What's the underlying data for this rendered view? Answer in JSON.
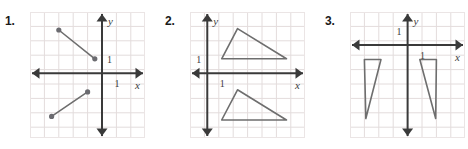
{
  "page": {
    "background": "#ffffff",
    "width": 468,
    "height": 149
  },
  "style": {
    "grid_line_color": "#e3dcdc",
    "panel_border_color": "#ebe5e5",
    "axis_color": "#3a3a3a",
    "figure_color": "#6e6e6e",
    "point_color": "#6b6b70",
    "label_color": "#3b3b3b",
    "number_color": "#1a1a1a"
  },
  "problems": [
    {
      "number": "1.",
      "panel": {
        "x": 30,
        "y": 12,
        "width": 115,
        "height": 126,
        "cell": 14.4,
        "cols": 8,
        "rows": 8.75,
        "origin_col": 5,
        "origin_row": 4.25
      },
      "axes": {
        "x_label": "x",
        "y_label": "y",
        "x_tick_label": "1",
        "y_tick_label": "1"
      },
      "figures": [
        {
          "name": "segment-upper",
          "type": "segment",
          "points": [
            [
              -3,
              3
            ],
            [
              -0.5,
              1
            ]
          ],
          "endpoints_marked": true
        },
        {
          "name": "segment-lower",
          "type": "segment",
          "points": [
            [
              -3.5,
              -3
            ],
            [
              -1,
              -1.3
            ]
          ],
          "endpoints_marked": true
        }
      ]
    },
    {
      "number": "2.",
      "panel": {
        "x": 190,
        "y": 12,
        "width": 115,
        "height": 126,
        "cell": 14.4,
        "cols": 8,
        "rows": 8.75,
        "origin_col": 1.2,
        "origin_row": 4.25
      },
      "axes": {
        "x_label": "x",
        "y_label": "y",
        "x_tick_label": "1",
        "y_tick_label": "1"
      },
      "figures": [
        {
          "name": "triangle-upper",
          "type": "polygon",
          "points": [
            [
              1,
              1
            ],
            [
              2.1,
              3.1
            ],
            [
              5.5,
              1
            ]
          ]
        },
        {
          "name": "triangle-lower",
          "type": "polygon",
          "points": [
            [
              1,
              -3.25
            ],
            [
              2.1,
              -1.15
            ],
            [
              5.5,
              -3.25
            ]
          ]
        }
      ]
    },
    {
      "number": "3.",
      "panel": {
        "x": 350,
        "y": 12,
        "width": 115,
        "height": 126,
        "cell": 14.4,
        "cols": 8,
        "rows": 8.75,
        "origin_col": 4,
        "origin_row": 2.3
      },
      "axes": {
        "x_label": "x",
        "y_label": "y",
        "x_tick_label": "1",
        "y_tick_label": "1"
      },
      "figures": [
        {
          "name": "triangle-left",
          "type": "polygon",
          "points": [
            [
              -3,
              -1
            ],
            [
              -1.85,
              -1
            ],
            [
              -2.9,
              -5.1
            ]
          ]
        },
        {
          "name": "triangle-right",
          "type": "polygon",
          "points": [
            [
              0.85,
              -1
            ],
            [
              2,
              -1
            ],
            [
              1.95,
              -5.1
            ]
          ]
        }
      ]
    }
  ]
}
